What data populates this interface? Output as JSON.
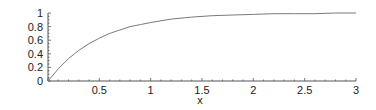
{
  "chart_data": {
    "type": "line",
    "title": "",
    "xlabel": "x",
    "ylabel": "",
    "xlim": [
      0,
      3
    ],
    "ylim": [
      0,
      1
    ],
    "grid": false,
    "legend": null,
    "x_ticks": [
      "0.5",
      "1",
      "1.5",
      "2",
      "2.5",
      "3"
    ],
    "y_ticks": [
      "0",
      "0.2",
      "0.4",
      "0.6",
      "0.8",
      "1"
    ],
    "series": [
      {
        "name": "curve",
        "color": "#7a7a7a",
        "x": [
          0,
          0.1,
          0.2,
          0.3,
          0.4,
          0.5,
          0.6,
          0.7,
          0.8,
          0.9,
          1.0,
          1.2,
          1.4,
          1.6,
          1.8,
          2.0,
          2.2,
          2.4,
          2.6,
          2.8,
          3.0
        ],
        "values": [
          0,
          0.18,
          0.33,
          0.45,
          0.55,
          0.63,
          0.7,
          0.75,
          0.8,
          0.83,
          0.86,
          0.91,
          0.94,
          0.96,
          0.97,
          0.98,
          0.99,
          0.99,
          0.99,
          1.0,
          1.0
        ]
      }
    ]
  },
  "colors": {
    "axis": "#555555",
    "curve": "#7a7a7a",
    "text": "#222222"
  }
}
